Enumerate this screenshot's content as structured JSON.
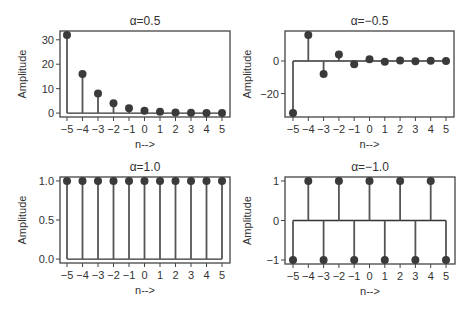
{
  "chart_data": [
    {
      "type": "stem",
      "title": "α=0.5",
      "xlabel": "n-->",
      "ylabel": "Amplitude",
      "x": [
        -5,
        -4,
        -3,
        -2,
        -1,
        0,
        1,
        2,
        3,
        4,
        5
      ],
      "values": [
        32,
        16,
        8,
        4,
        2,
        1,
        0.5,
        0.25,
        0.125,
        0.0625,
        0.03125
      ],
      "xticks": [
        "−5",
        "−4",
        "−3",
        "−2",
        "−1",
        "0",
        "1",
        "2",
        "3",
        "4",
        "5"
      ],
      "yticks": [
        0,
        10,
        20,
        30
      ],
      "ytick_labels": [
        "0",
        "10",
        "20",
        "30"
      ],
      "ylim": [
        -1.6,
        33.6
      ],
      "grid": false,
      "box": {
        "left": 60,
        "top": 31,
        "right": 230,
        "bottom": 117
      },
      "xrange_px": [
        67,
        222
      ]
    },
    {
      "type": "stem",
      "title": "α=−0.5",
      "xlabel": "n-->",
      "ylabel": "Amplitude",
      "x": [
        -5,
        -4,
        -3,
        -2,
        -1,
        0,
        1,
        2,
        3,
        4,
        5
      ],
      "values": [
        -32,
        16,
        -8,
        4,
        -2,
        1,
        -0.5,
        0.25,
        -0.125,
        0.0625,
        -0.03125
      ],
      "xticks": [
        "−5",
        "−4",
        "−3",
        "−2",
        "−1",
        "0",
        "1",
        "2",
        "3",
        "4",
        "5"
      ],
      "yticks": [
        -20,
        0
      ],
      "ytick_labels": [
        "−20",
        "0"
      ],
      "ylim": [
        -34.4,
        18.4
      ],
      "grid": false,
      "box": {
        "left": 285,
        "top": 31,
        "right": 454,
        "bottom": 117
      },
      "xrange_px": [
        293,
        446
      ]
    },
    {
      "type": "stem",
      "title": "α=1.0",
      "xlabel": "n-->",
      "ylabel": "Amplitude",
      "x": [
        -5,
        -4,
        -3,
        -2,
        -1,
        0,
        1,
        2,
        3,
        4,
        5
      ],
      "values": [
        1,
        1,
        1,
        1,
        1,
        1,
        1,
        1,
        1,
        1,
        1
      ],
      "xticks": [
        "−5",
        "−4",
        "−3",
        "−2",
        "−1",
        "0",
        "1",
        "2",
        "3",
        "4",
        "5"
      ],
      "yticks": [
        0,
        0.5,
        1.0
      ],
      "ytick_labels": [
        "0.0",
        "0.5",
        "1.0"
      ],
      "ylim": [
        -0.05,
        1.05
      ],
      "grid": false,
      "box": {
        "left": 60,
        "top": 177,
        "right": 230,
        "bottom": 263
      },
      "xrange_px": [
        67,
        222
      ]
    },
    {
      "type": "stem",
      "title": "α=−1.0",
      "xlabel": "n-->",
      "ylabel": "Amplitude",
      "x": [
        -5,
        -4,
        -3,
        -2,
        -1,
        0,
        1,
        2,
        3,
        4,
        5
      ],
      "values": [
        -1,
        1,
        -1,
        1,
        -1,
        1,
        -1,
        1,
        -1,
        1,
        -1
      ],
      "xticks": [
        "−5",
        "−4",
        "−3",
        "−2",
        "−1",
        "0",
        "1",
        "2",
        "3",
        "4",
        "5"
      ],
      "yticks": [
        -1,
        0,
        1
      ],
      "ytick_labels": [
        "−1",
        "0",
        "1"
      ],
      "ylim": [
        -1.1,
        1.1
      ],
      "grid": false,
      "box": {
        "left": 285,
        "top": 177,
        "right": 455,
        "bottom": 264
      },
      "xrange_px": [
        293,
        446
      ]
    }
  ]
}
